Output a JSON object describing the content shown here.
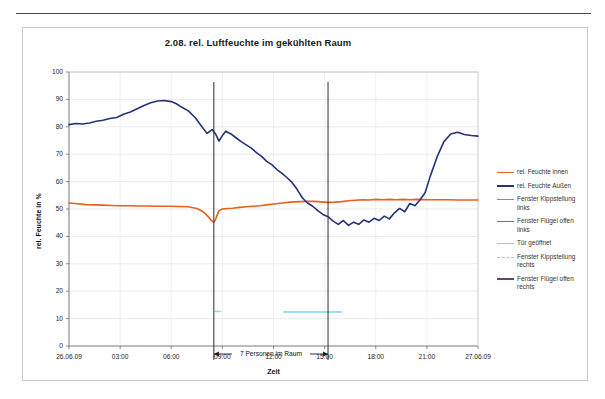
{
  "chart_data": {
    "type": "line",
    "title": "2.08. rel. Luftfeuchte im gekühlten Raum",
    "xlabel": "Zeit",
    "ylabel": "rel. Feuchte in %",
    "ylim": [
      0,
      100
    ],
    "ytick_step": 10,
    "yticks": [
      "0",
      "10",
      "20",
      "30",
      "40",
      "50",
      "60",
      "70",
      "80",
      "90",
      "100"
    ],
    "xticks": [
      "26.06.09",
      "03:00",
      "06:00",
      "09:00",
      "12:00",
      "15:00",
      "18:00",
      "21:00",
      "27.06.09"
    ],
    "xlim_hours": [
      0,
      24
    ],
    "grid": true,
    "legend_position": "right",
    "annotations": [
      {
        "text": "7 Personen im Raum",
        "type": "span-arrow",
        "x_start_hour": 8.5,
        "x_end_hour": 15.2,
        "y_value": 15
      },
      {
        "text": "",
        "type": "vline",
        "x_hour": 8.5
      },
      {
        "text": "",
        "type": "vline",
        "x_hour": 15.2
      }
    ],
    "series": [
      {
        "name": "rel. Feuchte innen",
        "color": "#E8601C",
        "style": "solid",
        "x": [
          0,
          0.5,
          1,
          1.5,
          2,
          2.5,
          3,
          3.5,
          4,
          4.5,
          5,
          5.5,
          6,
          6.5,
          7,
          7.5,
          7.8,
          8,
          8.2,
          8.35,
          8.5,
          8.6,
          8.8,
          9,
          9.3,
          9.6,
          10,
          10.4,
          10.8,
          11.2,
          11.6,
          12,
          12.4,
          12.8,
          13.2,
          13.6,
          14,
          14.4,
          14.8,
          15.2,
          15.6,
          16,
          16.4,
          16.8,
          17.2,
          17.6,
          18,
          18.4,
          18.8,
          19.2,
          19.6,
          20,
          20.4,
          21,
          21.6,
          22.2,
          22.8,
          23.4,
          24
        ],
        "y": [
          52.2,
          51.9,
          51.6,
          51.5,
          51.4,
          51.3,
          51.2,
          51.2,
          51.1,
          51.1,
          51.0,
          51.0,
          51.0,
          50.9,
          50.8,
          50.2,
          49.3,
          48.3,
          47.0,
          45.8,
          45.2,
          46.2,
          49.4,
          50.0,
          50.2,
          50.3,
          50.6,
          50.8,
          51.0,
          51.2,
          51.5,
          51.8,
          52.1,
          52.4,
          52.6,
          52.7,
          52.8,
          52.8,
          52.6,
          52.4,
          52.5,
          52.7,
          53.0,
          53.2,
          53.4,
          53.3,
          53.5,
          53.4,
          53.5,
          53.4,
          53.5,
          53.4,
          53.5,
          53.4,
          53.4,
          53.4,
          53.3,
          53.3,
          53.3
        ]
      },
      {
        "name": "rel. Feuchte Außen",
        "color": "#27317A",
        "style": "solid",
        "x": [
          0,
          0.4,
          0.8,
          1.2,
          1.6,
          2,
          2.4,
          2.8,
          3.2,
          3.6,
          4,
          4.4,
          4.8,
          5.2,
          5.6,
          6,
          6.3,
          6.6,
          7,
          7.4,
          7.8,
          8.1,
          8.4,
          8.6,
          8.8,
          9,
          9.2,
          9.5,
          9.8,
          10.1,
          10.4,
          10.7,
          11,
          11.3,
          11.6,
          11.9,
          12.2,
          12.5,
          12.8,
          13.1,
          13.4,
          13.7,
          14,
          14.3,
          14.6,
          14.9,
          15.2,
          15.5,
          15.8,
          16.1,
          16.4,
          16.7,
          17,
          17.3,
          17.6,
          17.9,
          18.2,
          18.5,
          18.8,
          19.1,
          19.4,
          19.7,
          20,
          20.3,
          20.6,
          20.9,
          21.2,
          21.6,
          22,
          22.4,
          22.8,
          23.2,
          23.6,
          24
        ],
        "y": [
          80.8,
          81.2,
          81.0,
          81.4,
          82.0,
          82.4,
          83.0,
          83.4,
          84.6,
          85.4,
          86.6,
          87.8,
          88.8,
          89.4,
          89.6,
          89.2,
          88.4,
          87.2,
          85.8,
          83.4,
          80.0,
          77.6,
          79.0,
          77.4,
          74.8,
          76.8,
          78.4,
          77.4,
          76.0,
          74.6,
          73.4,
          72.2,
          70.6,
          69.2,
          67.4,
          66.2,
          64.4,
          63.0,
          61.4,
          59.6,
          57.0,
          54.0,
          52.2,
          51.0,
          49.4,
          48.0,
          47.2,
          45.6,
          44.4,
          45.8,
          44.0,
          45.2,
          44.4,
          46.0,
          45.2,
          46.6,
          45.8,
          47.4,
          46.4,
          48.6,
          50.2,
          49.0,
          52.0,
          51.2,
          53.4,
          56.0,
          62.0,
          69.0,
          74.6,
          77.4,
          78.0,
          77.2,
          76.8,
          76.6
        ]
      },
      {
        "name": "Fenster Kippstellung links",
        "color": "#5BA85B",
        "style": "solid",
        "x": [],
        "y": []
      },
      {
        "name": "Fenster Flügel offen links",
        "color": "#8E5B8E",
        "style": "solid",
        "x": [],
        "y": []
      },
      {
        "name": "Tür geöffnet",
        "color": "#7FD3E8",
        "style": "solid",
        "x": [
          12.6,
          13.0,
          13.6,
          14.0,
          14.6,
          15.5,
          16.0
        ],
        "y": [
          12.4,
          12.4,
          12.4,
          12.4,
          12.4,
          12.4,
          12.4
        ]
      },
      {
        "name": "Fenster Kippstellung rechts",
        "color": "#7FD3E8",
        "style": "dashed",
        "x": [
          8.6,
          8.9
        ],
        "y": [
          12.6,
          12.6
        ]
      },
      {
        "name": "Fenster Flügel offen rechts",
        "color": "#6B3D7A",
        "style": "solid",
        "x": [],
        "y": []
      }
    ]
  }
}
